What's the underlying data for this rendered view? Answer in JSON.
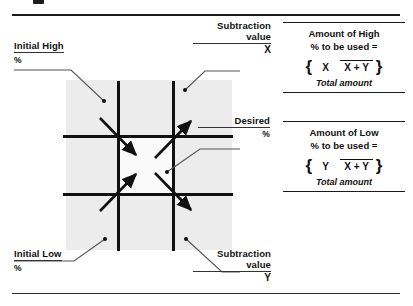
{
  "figure": {
    "top_rule": true,
    "bottom_rule": true,
    "cropped_glyph": "partial-text-above-rule"
  },
  "diagram": {
    "name": "pearsons-square",
    "callouts": [
      {
        "id": "initial-high",
        "label": "Initial High",
        "unit": "%",
        "position": "top-left",
        "leader_to": "top-left-quadrant"
      },
      {
        "id": "subtraction-value-x",
        "label": "Subtraction",
        "label2": "value",
        "variable": "X",
        "position": "top-right",
        "leader_to": "top-right-quadrant"
      },
      {
        "id": "desired",
        "label": "Desired",
        "unit": "%",
        "position": "middle-right",
        "leader_to": "center-square"
      },
      {
        "id": "initial-low",
        "label": "Initial Low",
        "unit": "%",
        "position": "bottom-left",
        "leader_to": "bottom-left-quadrant"
      },
      {
        "id": "subtraction-value-y",
        "label": "Subtraction",
        "label2": "value",
        "variable": "Y",
        "position": "bottom-right",
        "leader_to": "bottom-right-quadrant"
      }
    ],
    "arrows": [
      {
        "id": "arrow-tl-inward",
        "from": "top-left",
        "to": "center",
        "direction": "down-right"
      },
      {
        "id": "arrow-tr-outward",
        "from": "center",
        "to": "top-right",
        "direction": "up-right"
      },
      {
        "id": "arrow-bl-inward",
        "from": "bottom-left",
        "to": "center",
        "direction": "up-right"
      },
      {
        "id": "arrow-br-outward",
        "from": "center",
        "to": "bottom-right",
        "direction": "down-right"
      }
    ],
    "shading_color": "#ececec",
    "line_color": "#111111"
  },
  "formulas": {
    "high": {
      "id": "amount-of-high",
      "line1": "Amount of High",
      "line2": "% to be used =",
      "brace_open": "{",
      "brace_close": "}",
      "numerator": "X",
      "denominator": "X + Y",
      "footer": "Total amount"
    },
    "low": {
      "id": "amount-of-low",
      "line1": "Amount of Low",
      "line2": "% to be used =",
      "brace_open": "{",
      "brace_close": "}",
      "numerator": "Y",
      "denominator": "X + Y",
      "footer": "Total amount"
    }
  }
}
